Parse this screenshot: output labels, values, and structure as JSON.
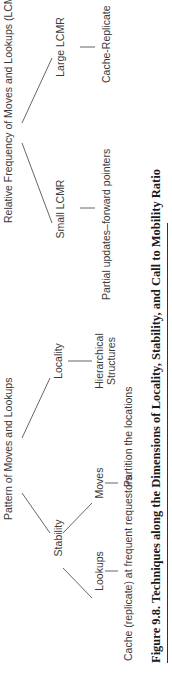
{
  "figure": {
    "caption": "Figure 9.8.  Techniques along the Dimensions of Locality, Stability, and Call to Mobility Ratio"
  },
  "tree_left": {
    "root": "Pattern of Moves and Lookups",
    "branches": [
      {
        "label": "Stability",
        "children": [
          {
            "label": "Lookups",
            "technique": "Cache (replicate) at frequent requestors"
          },
          {
            "label": "Moves",
            "technique": "Partition the locations"
          }
        ]
      },
      {
        "label": "Locality",
        "children": [
          {
            "label_line1": "Hierarchical",
            "label_line2": "Structures"
          }
        ]
      }
    ]
  },
  "tree_right": {
    "root": "Relative Frequency of Moves and Lookups (LCMR)",
    "branches": [
      {
        "label": "Small LCMR",
        "technique": "Partial updates–forward pointers"
      },
      {
        "label": "Large LCMR",
        "technique": "Cache-Replicate"
      }
    ]
  }
}
